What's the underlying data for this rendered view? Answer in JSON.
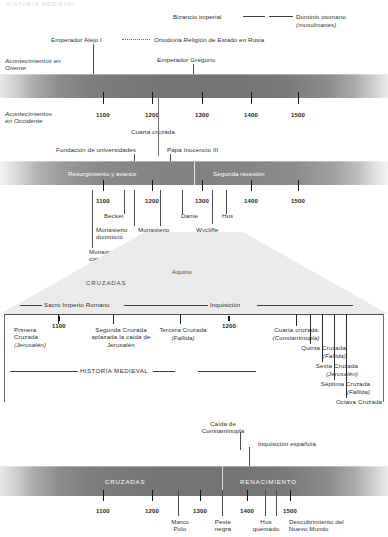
{
  "page": {
    "faint_header": "HISTORIA MEDIEVAL",
    "legend": {
      "byzantine": "Bizancio imperial",
      "ottoman": "Dominio otomano",
      "ottoman_sub": "(musulmanes)"
    }
  },
  "east": {
    "axis_label_line1": "Acontecimientos en",
    "axis_label_line2": "Oriente",
    "events": [
      {
        "label": "Emperador Alejo I"
      },
      {
        "label": "Ortodoxia Religión de Estado en Rusia"
      },
      {
        "label": "Emperador Gregorio"
      }
    ]
  },
  "west": {
    "axis_label_line1": "Acontecimientos",
    "axis_label_line2": "en Occidente",
    "ticks": [
      "1100",
      "1200",
      "1300",
      "1400",
      "1500"
    ],
    "events": [
      {
        "label": "Cuarta cruzada"
      },
      {
        "label": "Fundación de universidades"
      },
      {
        "label": "Papa Inocencio III"
      }
    ],
    "band_labels": [
      "Resurgimiento y avance",
      "Segunda recesión"
    ]
  },
  "figures": {
    "ticks": [
      "1100",
      "1200",
      "1300",
      "1400",
      "1500"
    ],
    "events": [
      {
        "label": "Becket"
      },
      {
        "label": "Monasterio\ndominicio"
      },
      {
        "label": "Monasterio\nfranciscano"
      },
      {
        "label": "Dante"
      },
      {
        "label": "Wycliffe"
      },
      {
        "label": "Hus"
      },
      {
        "label": "Monasterio\ncisterciense"
      }
    ]
  },
  "wedge": {
    "labels": [
      "CRUZADAS",
      "Aquino"
    ]
  },
  "crusades_detail": {
    "spans": [
      "Sacro Imperio Romano",
      "Inquisición"
    ],
    "center_label": "HISTORIA MEDIEVAL",
    "ticks": [
      "1100",
      "1200"
    ],
    "items": [
      {
        "name": "Primera\nCruzada",
        "note": "(Jerusalén)"
      },
      {
        "name": "Segunda Cruzada\naplazada la caída de\nJerusalén",
        "note": ""
      },
      {
        "name": "Tercera Cruzada",
        "note": "(Fallida)"
      },
      {
        "name": "Cuarta cruzada",
        "note": "(Constantinopla)"
      },
      {
        "name": "Quinta Cruzada",
        "note": "(Fallida)"
      },
      {
        "name": "Sexta Cruzada",
        "note": "(Jerusalén)"
      },
      {
        "name": "Séptima Cruzada",
        "note": "(Fallida)"
      },
      {
        "name": "Octava Cruzada",
        "note": ""
      }
    ],
    "bottom_events": [
      {
        "label": "Caída de\nConstantinopla"
      },
      {
        "label": "Inquisición española"
      }
    ]
  },
  "summary": {
    "band_labels": [
      "CRUZADAS",
      "RENACIMIENTO"
    ],
    "ticks": [
      "1100",
      "1200",
      "1300",
      "1400",
      "1500"
    ],
    "events": [
      {
        "label": "Marco\nPolo"
      },
      {
        "label": "Peste\nnegra"
      },
      {
        "label": "Hus\nquemado"
      },
      {
        "label": "Descubrimiento del\nNuevo Mundo"
      }
    ]
  }
}
